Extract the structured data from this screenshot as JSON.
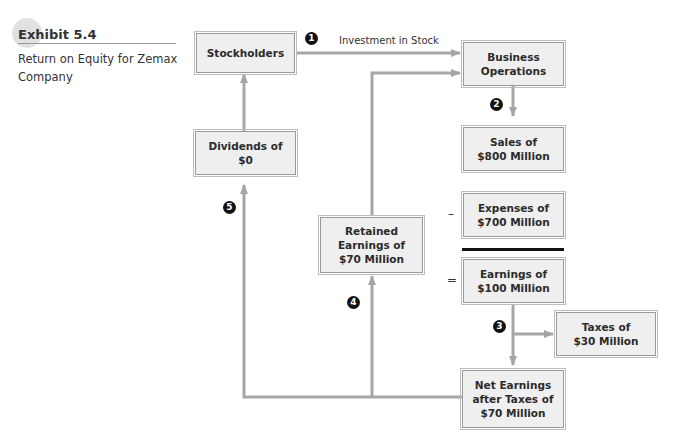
{
  "exhibit": {
    "title": "Exhibit 5.4",
    "caption": "Return on Equity for Zemax Company"
  },
  "nodes": {
    "stockholders": "Stockholders",
    "business_operations": "Business\nOperations",
    "sales": "Sales of\n$800 Million",
    "expenses": "Expenses of\n$700 Million",
    "earnings": "Earnings of\n$100 Million",
    "taxes": "Taxes of\n$30 Million",
    "net_earnings": "Net Earnings\nafter Taxes of\n$70 Million",
    "retained_earnings": "Retained\nEarnings of\n$70 Million",
    "dividends": "Dividends of\n$0"
  },
  "edges": {
    "investment_label": "Investment in Stock"
  },
  "operators": {
    "minus": "–",
    "equals": "="
  },
  "steps": [
    "1",
    "2",
    "3",
    "4",
    "5"
  ],
  "colors": {
    "connector": "#a6a6a6",
    "box_fill": "#efefef",
    "box_border": "#9a9a9a",
    "step_marker": "#111111"
  }
}
